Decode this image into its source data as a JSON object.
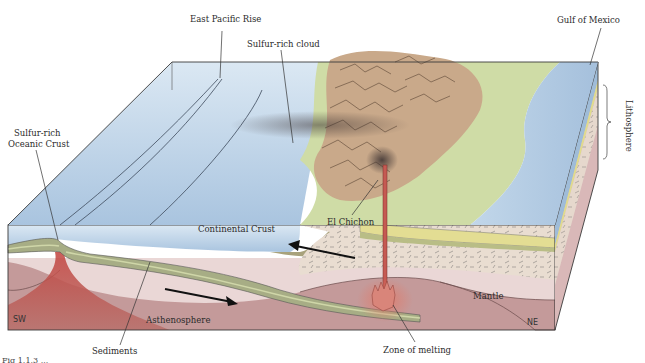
{
  "diagram": {
    "labels": {
      "east_pacific_rise": "East Pacific Rise",
      "sulfur_rich_cloud": "Sulfur-rich cloud",
      "gulf_of_mexico": "Gulf of Mexico",
      "lithosphere": "Lithosphere",
      "sulfur_rich_oceanic_crust_line1": "Sulfur-rich",
      "sulfur_rich_oceanic_crust_line2": "Oceanic Crust",
      "continental_crust": "Continental Crust",
      "el_chichon": "El Chichon",
      "mantle": "Mantle",
      "asthenosphere": "Asthenosphere",
      "sediments": "Sediments",
      "zone_of_melting": "Zone of melting",
      "sw": "SW",
      "ne": "NE"
    },
    "arrows": [
      {
        "name": "plate-motion-arrow-ne",
        "direction": "to NE (right)",
        "location": "asthenosphere"
      },
      {
        "name": "plate-motion-arrow-sw",
        "direction": "to SW (left)",
        "location": "continental crust"
      }
    ],
    "colors": {
      "ocean": "#b8d0e6",
      "ocean_light": "#dce9f4",
      "land_green": "#cfdca6",
      "mountains": "#c9a98a",
      "continental_crust": "#e8ddd2",
      "oceanic_crust_band": "#9ea77a",
      "lithosphere_mantle": "#ead7d6",
      "asthenosphere": "#c79b9b",
      "magma": "#b9443e",
      "yellow_layer": "#e0dc8c"
    },
    "caption_partial": "Fig 1.1.3 ..."
  }
}
